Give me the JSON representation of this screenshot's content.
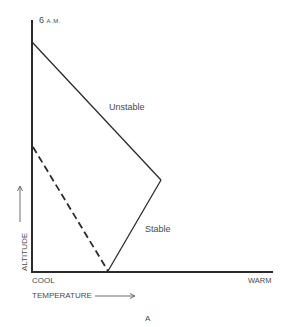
{
  "diagram": {
    "time_label_number": "6",
    "time_label_suffix": "A.M.",
    "panel_label": "A",
    "axes": {
      "x_label": "TEMPERATURE",
      "x_min_label": "COOL",
      "x_max_label": "WARM",
      "y_label": "ALTITUDE"
    },
    "curves": [
      {
        "name": "environmental-profile",
        "style": "solid",
        "points": [
          [
            32,
            42
          ],
          [
            161,
            180
          ],
          [
            108,
            271
          ]
        ]
      },
      {
        "name": "dashed-profile",
        "style": "dashed",
        "points": [
          [
            33,
            147
          ],
          [
            108,
            271
          ]
        ]
      }
    ],
    "annotations": {
      "unstable": "Unstable",
      "stable": "Stable"
    },
    "colors": {
      "line": "#2b2b2b",
      "text": "#4a4a4a",
      "background": "#ffffff"
    }
  }
}
